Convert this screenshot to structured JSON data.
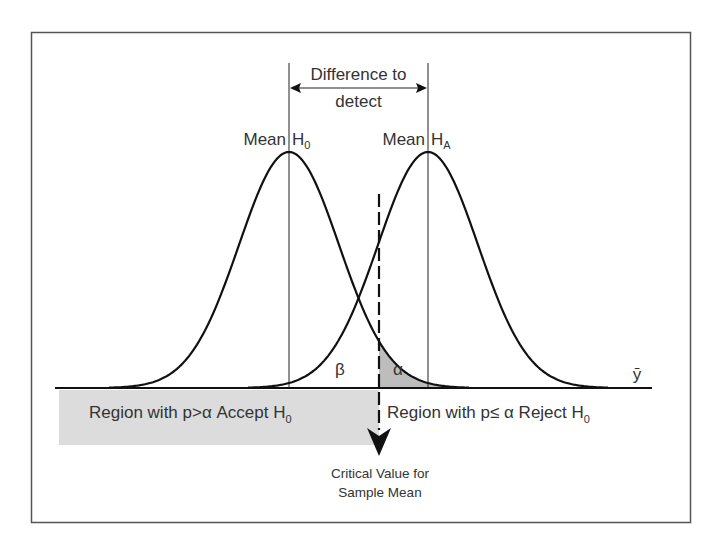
{
  "diagram": {
    "labels": {
      "difference_line1": "Difference to",
      "difference_line2": "detect",
      "mean_h0_word": "Mean",
      "mean_h0_h": "H",
      "mean_h0_sub": "0",
      "mean_ha_word": "Mean",
      "mean_ha_h": "H",
      "mean_ha_sub": "A",
      "beta": "β",
      "alpha": "α",
      "axis_var": "ȳ",
      "accept_region": "Region with p>α Accept H",
      "accept_sub": "0",
      "reject_region": "Region with p≤ α Reject H",
      "reject_sub": "0",
      "critical_line1": "Critical Value for",
      "critical_line2": "Sample Mean"
    },
    "colors": {
      "frame": "#555555",
      "curve": "#111111",
      "shade_alpha": "#bdbdbd",
      "shade_accept": "#dcdcdc",
      "text": "#333333"
    },
    "geometry": {
      "baseline_y": 388,
      "h0_mean_x": 289,
      "ha_mean_x": 428,
      "critical_x": 379,
      "peak_y": 152,
      "sigma_px": 50
    }
  }
}
